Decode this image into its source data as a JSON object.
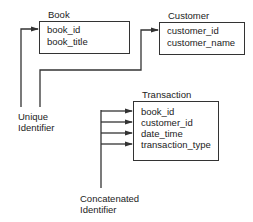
{
  "entities": [
    {
      "name": "Book",
      "fields": [
        "book_id",
        "book_title"
      ]
    },
    {
      "name": "Customer",
      "fields": [
        "customer_id",
        "customer_name"
      ]
    },
    {
      "name": "Transaction",
      "fields": [
        "book_id",
        "customer_id",
        "date_time",
        "transaction_type"
      ]
    }
  ],
  "annotations": {
    "unique": [
      "Unique",
      "Identifier"
    ],
    "concatenated": [
      "Concatenated",
      "Identifier"
    ]
  },
  "colors": {
    "line": "#333333",
    "text": "#222222",
    "background": "#ffffff"
  }
}
